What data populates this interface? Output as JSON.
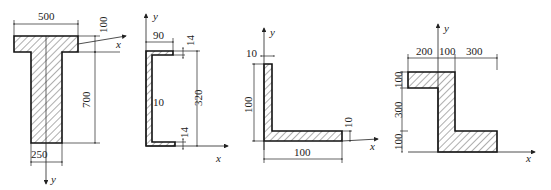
{
  "figures": [
    {
      "name": "T-section",
      "dims": {
        "flange_width": "500",
        "flange_thickness": "100",
        "web_height": "700",
        "web_width": "250"
      },
      "axes": {
        "x": "x",
        "y": "y"
      }
    },
    {
      "name": "channel-section",
      "dims": {
        "flange_width": "90",
        "top_flange_thickness": "14",
        "height": "320",
        "web_thickness": "10",
        "bottom_flange_thickness": "14"
      },
      "axes": {
        "x": "x",
        "y": "y"
      }
    },
    {
      "name": "angle-section",
      "dims": {
        "vertical_leg_thickness": "10",
        "vertical_leg_height": "100",
        "horizontal_leg_width": "100",
        "horizontal_leg_thickness": "10"
      },
      "axes": {
        "x": "x",
        "y": "y"
      }
    },
    {
      "name": "Z-section",
      "dims": {
        "top_left_width": "200",
        "web_width": "100",
        "bottom_right_width": "300",
        "top_flange_thickness": "100",
        "web_height": "300",
        "bottom_flange_thickness": "100"
      },
      "axes": {
        "x": "x",
        "y": "y"
      }
    }
  ],
  "colors": {
    "line": "#111111",
    "background": "#ffffff"
  }
}
